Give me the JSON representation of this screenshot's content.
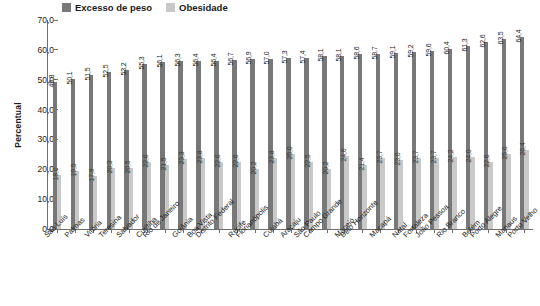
{
  "legend": {
    "items": [
      {
        "label": "Excesso de peso",
        "color": "#787878",
        "icon": "square-swatch-icon"
      },
      {
        "label": "Obesidade",
        "color": "#c9c9c9",
        "icon": "square-swatch-icon"
      }
    ]
  },
  "axis": {
    "ylabel": "Percentual",
    "yticks": [
      "70,0",
      "60,0",
      "50,0",
      "40,0",
      "30,0",
      "20,0",
      "10,0",
      "0,0"
    ]
  },
  "caption": "",
  "chart_data": {
    "type": "bar",
    "title": "",
    "xlabel": "",
    "ylabel": "Percentual",
    "ylim": [
      0,
      70
    ],
    "ytick_step": 10,
    "grid": false,
    "legend_position": "top",
    "value_labels": true,
    "decimal_separator": ",",
    "categories": [
      "São Luís",
      "Palmas",
      "Vitória",
      "Teresina",
      "Salvador",
      "Curitiba",
      "Rio de Janeiro",
      "Goiânia",
      "Boa Vista",
      "Distrito Federal",
      "Recife",
      "Florianópolis",
      "Cuiabá",
      "Aracaju",
      "São Paulo",
      "Campo Grande",
      "Maceió",
      "Belo Horizonte",
      "Macapá",
      "Natal",
      "Fortaleza",
      "João Pessoa",
      "Rio Branco",
      "Belém",
      "Porto Alegre",
      "Manaus",
      "Porto Velho"
    ],
    "series": [
      {
        "name": "Excesso de peso",
        "color": "#787878",
        "values": [
          49.3,
          50.1,
          51.5,
          52.5,
          53.2,
          55.3,
          56.1,
          56.3,
          56.4,
          56.4,
          56.7,
          56.9,
          57.0,
          57.3,
          57.4,
          58.1,
          58.1,
          58.6,
          58.7,
          59.1,
          59.2,
          59.6,
          60.4,
          61.3,
          62.6,
          63.5,
          64.4
        ],
        "labels": [
          "49,3",
          "50,1",
          "51,5",
          "52,5",
          "53,2",
          "55,3",
          "56,1",
          "56,3",
          "56,4",
          "56,4",
          "56,7",
          "56,9",
          "57,0",
          "57,3",
          "57,4",
          "58,1",
          "58,1",
          "58,6",
          "58,7",
          "59,1",
          "59,2",
          "59,6",
          "60,4",
          "61,3",
          "62,6",
          "63,5",
          "64,4"
        ]
      },
      {
        "name": "Obesidade",
        "color": "#c9c9c9",
        "values": [
          18.0,
          19.5,
          17.9,
          20.3,
          20.5,
          22.6,
          21.5,
          23.3,
          23.8,
          22.6,
          22.6,
          20.2,
          23.8,
          25.0,
          22.5,
          20.2,
          24.6,
          21.4,
          23.7,
          23.0,
          23.7,
          23.7,
          24.2,
          24.0,
          22.6,
          25.0,
          26.4
        ],
        "labels": [
          "18,0",
          "19,5",
          "17,9",
          "20,3",
          "20,5",
          "22,6",
          "21,5",
          "23,3",
          "23,8",
          "22,6",
          "22,6",
          "20,2",
          "23,8",
          "25,0",
          "22,5",
          "20,2",
          "24,6",
          "21,4",
          "23,7",
          "23,0",
          "23,7",
          "23,7",
          "24,2",
          "24,0",
          "22,6",
          "25,0",
          "26,4"
        ]
      }
    ]
  }
}
